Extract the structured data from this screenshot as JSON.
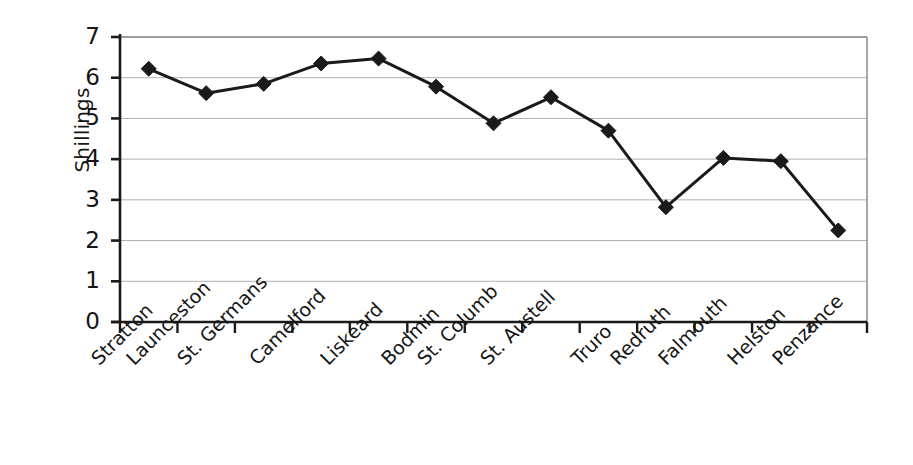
{
  "chart_data": {
    "type": "line",
    "title": "",
    "xlabel": "",
    "ylabel": "Shillings",
    "ylim": [
      0,
      7
    ],
    "ytick_labels": [
      "0",
      "1",
      "2",
      "3",
      "4",
      "5",
      "6",
      "7"
    ],
    "grid": true,
    "legend": false,
    "marker": "diamond",
    "line_color": "#1a1a1a",
    "marker_color": "#1a1a1a",
    "grid_color": "#b0b0b0",
    "axis_color": "#1a1a1a",
    "categories": [
      "Stratton",
      "Launceston",
      "St. Germans",
      "Camelford",
      "Liskeard",
      "Bodmin",
      "St. Columb",
      "St. Austell",
      "Truro",
      "Redruth",
      "Falmouth",
      "Helston",
      "Penzance"
    ],
    "values": [
      6.22,
      5.62,
      5.85,
      6.35,
      6.47,
      5.78,
      4.88,
      5.52,
      4.7,
      2.82,
      4.03,
      3.95,
      2.25
    ]
  }
}
